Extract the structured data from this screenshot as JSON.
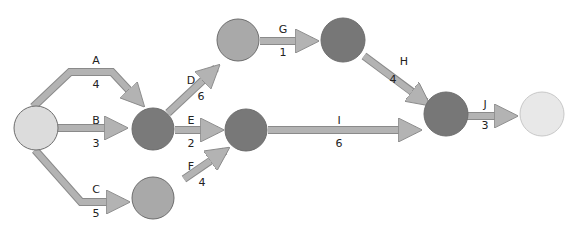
{
  "diagram": {
    "type": "activity-on-arrow network",
    "colors": {
      "arrow_fill": "#b3b3b3",
      "arrow_stroke": "#8a8a8a",
      "node_stroke": "#6d6d6d",
      "node_light": "#dcdcdc",
      "node_mid": "#a8a8a8",
      "node_dark": "#7a7a7a",
      "node_end": "#e8e8e8",
      "label": "#222222"
    },
    "nodes": [
      {
        "id": "n1",
        "role": "start"
      },
      {
        "id": "n2"
      },
      {
        "id": "n3"
      },
      {
        "id": "n4"
      },
      {
        "id": "n5"
      },
      {
        "id": "n6"
      },
      {
        "id": "n7"
      },
      {
        "id": "n8",
        "role": "end"
      }
    ],
    "activities": [
      {
        "name": "A",
        "duration": "4",
        "from": "n1",
        "to": "n2"
      },
      {
        "name": "B",
        "duration": "3",
        "from": "n1",
        "to": "n2"
      },
      {
        "name": "C",
        "duration": "5",
        "from": "n1",
        "to": "n6"
      },
      {
        "name": "D",
        "duration": "6",
        "from": "n2",
        "to": "n3"
      },
      {
        "name": "E",
        "duration": "2",
        "from": "n2",
        "to": "n5"
      },
      {
        "name": "F",
        "duration": "4",
        "from": "n6",
        "to": "n5"
      },
      {
        "name": "G",
        "duration": "1",
        "from": "n3",
        "to": "n4"
      },
      {
        "name": "H",
        "duration": "4",
        "from": "n4",
        "to": "n7"
      },
      {
        "name": "I",
        "duration": "6",
        "from": "n5",
        "to": "n7"
      },
      {
        "name": "J",
        "duration": "3",
        "from": "n7",
        "to": "n8"
      }
    ]
  }
}
